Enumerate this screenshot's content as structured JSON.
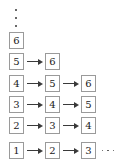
{
  "figure": {
    "type": "diagram",
    "top_ellipsis": "vertical-ellipsis",
    "trailing_ellipsis": "horizontal-ellipsis",
    "box_border_color": "#9a9a9a",
    "arrow_color": "#3a3a3a",
    "text_color": "#1a1a1a",
    "background_color": "#ffffff",
    "rows": [
      {
        "cells": [
          "6"
        ]
      },
      {
        "cells": [
          "5",
          "6"
        ]
      },
      {
        "cells": [
          "4",
          "5",
          "6"
        ]
      },
      {
        "cells": [
          "3",
          "4",
          "5"
        ]
      },
      {
        "cells": [
          "2",
          "3",
          "4"
        ]
      },
      {
        "cells": [
          "1",
          "2",
          "3"
        ],
        "trailing": "..."
      }
    ]
  }
}
